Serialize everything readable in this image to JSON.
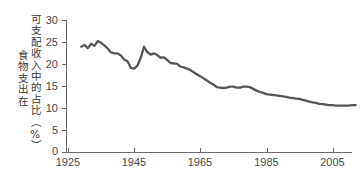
{
  "chart_data": {
    "type": "line",
    "title": "",
    "xlabel": "",
    "ylabel": "食物支出在可支配收入中的占比（%）",
    "ylabel_columns": [
      "可支配收入中的占比（%）",
      "食物支出在"
    ],
    "xlim": [
      1925,
      2013
    ],
    "ylim": [
      0,
      30
    ],
    "xticks": [
      1925,
      1945,
      1965,
      1985,
      2005
    ],
    "xtick_labels": [
      "1925",
      "1945",
      "1965",
      "1985",
      "2005"
    ],
    "yticks": [
      0,
      5,
      10,
      15,
      20,
      25,
      30
    ],
    "ytick_labels": [
      "0",
      "5",
      "10",
      "15",
      "20",
      "25",
      "30"
    ],
    "grid": false,
    "legend": "none",
    "series": [
      {
        "name": "食物支出占可支配收入比例",
        "color": "#565656",
        "x": [
          1929,
          1930,
          1931,
          1932,
          1933,
          1934,
          1935,
          1936,
          1937,
          1938,
          1939,
          1940,
          1941,
          1942,
          1943,
          1944,
          1945,
          1946,
          1947,
          1948,
          1949,
          1950,
          1951,
          1952,
          1953,
          1954,
          1955,
          1956,
          1957,
          1958,
          1959,
          1960,
          1961,
          1962,
          1963,
          1964,
          1965,
          1966,
          1967,
          1968,
          1969,
          1970,
          1971,
          1972,
          1973,
          1974,
          1975,
          1976,
          1977,
          1978,
          1979,
          1980,
          1981,
          1982,
          1983,
          1984,
          1985,
          1986,
          1987,
          1988,
          1989,
          1990,
          1991,
          1992,
          1993,
          1994,
          1995,
          1996,
          1997,
          1998,
          1999,
          2000,
          2001,
          2002,
          2003,
          2004,
          2005,
          2006,
          2007,
          2008,
          2009,
          2010,
          2011,
          2012
        ],
        "values": [
          23.9,
          24.3,
          23.6,
          24.6,
          24.1,
          25.2,
          24.8,
          24.2,
          23.5,
          22.6,
          22.4,
          22.4,
          21.9,
          21.0,
          20.6,
          19.1,
          18.9,
          19.6,
          21.4,
          23.9,
          22.7,
          22.1,
          22.4,
          22.0,
          21.4,
          21.5,
          20.9,
          20.2,
          20.1,
          20.0,
          19.4,
          19.2,
          18.9,
          18.6,
          18.1,
          17.6,
          17.2,
          16.7,
          16.2,
          15.7,
          15.3,
          14.7,
          14.6,
          14.5,
          14.6,
          14.8,
          14.8,
          14.6,
          14.6,
          14.8,
          14.8,
          14.7,
          14.3,
          13.9,
          13.6,
          13.4,
          13.1,
          13.0,
          12.9,
          12.8,
          12.7,
          12.6,
          12.5,
          12.3,
          12.2,
          12.1,
          12.0,
          11.8,
          11.6,
          11.4,
          11.2,
          11.1,
          10.9,
          10.8,
          10.7,
          10.6,
          10.6,
          10.5,
          10.5,
          10.5,
          10.5,
          10.5,
          10.6,
          10.6
        ]
      }
    ]
  },
  "axis": {
    "y_tick_labels": [
      "30",
      "25",
      "20",
      "15",
      "10",
      "5",
      "0"
    ],
    "x_tick_labels": [
      "1925",
      "1945",
      "1965",
      "1985",
      "2005"
    ]
  },
  "colors": {
    "line": "#565656",
    "axis": "#6b6b6b",
    "text": "#4a4a4a",
    "label_text": "#3a3a3a",
    "background": "#ffffff"
  }
}
